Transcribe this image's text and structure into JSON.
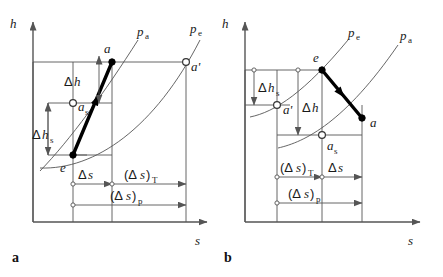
{
  "figure": {
    "axis": {
      "y_label": "h",
      "x_label": "s"
    },
    "colors": {
      "line": "#555555",
      "process": "#000000",
      "text": "#1a1a1a",
      "background": "#ffffff"
    },
    "panels": [
      {
        "id": "a",
        "caption": "a",
        "description": "Compression: state e compressed to state a",
        "curve_labels": [
          {
            "base": "p",
            "sub": "a"
          },
          {
            "base": "p",
            "sub": "e"
          }
        ],
        "points": [
          {
            "name": "e",
            "base": "e",
            "sub": "",
            "filled": true
          },
          {
            "name": "a",
            "base": "a",
            "sub": "",
            "filled": true
          },
          {
            "name": "a_s",
            "base": "a",
            "sub": "s",
            "filled": false
          },
          {
            "name": "a_prime",
            "base": "a'",
            "sub": "",
            "filled": false
          }
        ],
        "measures": [
          {
            "id": "delta-h",
            "prefix": "Δ",
            "base": "h",
            "sub": "",
            "orientation": "vertical"
          },
          {
            "id": "delta-h-s",
            "prefix": "Δ",
            "base": "h",
            "sub": "s",
            "orientation": "vertical"
          },
          {
            "id": "delta-s",
            "prefix": "Δ",
            "base": "s",
            "sub": "",
            "orientation": "horizontal"
          },
          {
            "id": "delta-s-T",
            "prefix": "(Δ",
            "base": "s",
            "suffix": ")",
            "sub": "T",
            "orientation": "horizontal"
          },
          {
            "id": "delta-s-p",
            "prefix": "(Δ",
            "base": "s",
            "suffix": ")",
            "sub": "p",
            "orientation": "horizontal"
          }
        ]
      },
      {
        "id": "b",
        "caption": "b",
        "description": "Expansion: state e expanded to state a",
        "curve_labels": [
          {
            "base": "p",
            "sub": "e"
          },
          {
            "base": "p",
            "sub": "a"
          }
        ],
        "points": [
          {
            "name": "e",
            "base": "e",
            "sub": "",
            "filled": true
          },
          {
            "name": "a",
            "base": "a",
            "sub": "",
            "filled": true
          },
          {
            "name": "a_s",
            "base": "a",
            "sub": "s",
            "filled": false
          },
          {
            "name": "a_prime",
            "base": "a'",
            "sub": "",
            "filled": false
          }
        ],
        "measures": [
          {
            "id": "delta-h-s",
            "prefix": "Δ",
            "base": "h",
            "sub": "s",
            "orientation": "vertical"
          },
          {
            "id": "delta-h",
            "prefix": "Δ",
            "base": "h",
            "sub": "",
            "orientation": "vertical"
          },
          {
            "id": "delta-s-T",
            "prefix": "(Δ",
            "base": "s",
            "suffix": ")",
            "sub": "T",
            "orientation": "horizontal"
          },
          {
            "id": "delta-s",
            "prefix": "Δ",
            "base": "s",
            "sub": "",
            "orientation": "horizontal"
          },
          {
            "id": "delta-s-p",
            "prefix": "(Δ",
            "base": "s",
            "suffix": ")",
            "sub": "p",
            "orientation": "horizontal"
          }
        ]
      }
    ],
    "text": {
      "h": "h",
      "s": "s",
      "p": "p",
      "sub_a": "a",
      "sub_e": "e",
      "sub_s": "s",
      "sub_T": "T",
      "sub_p": "p",
      "pt_e": "e",
      "pt_a": "a",
      "pt_a_prime": "a'",
      "delta": "Δ",
      "delta_h": "Δh",
      "delta_s": "Δs",
      "paren_open_delta": "(Δ",
      "paren_close": ")",
      "caption_a": "a",
      "caption_b": "b"
    }
  }
}
